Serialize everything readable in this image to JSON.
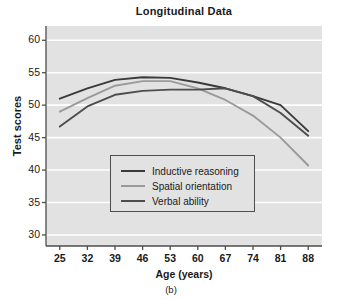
{
  "figure": {
    "caption": "(b)"
  },
  "chart_data": {
    "type": "line",
    "title": "Longitudinal Data",
    "xlabel": "Age (years)",
    "ylabel": "Test scores",
    "x": [
      25,
      32,
      39,
      46,
      53,
      60,
      67,
      74,
      81,
      88
    ],
    "categories": [
      "25",
      "32",
      "39",
      "46",
      "53",
      "60",
      "67",
      "74",
      "81",
      "88"
    ],
    "xlim": [
      21.5,
      91.5
    ],
    "ylim": [
      28.3,
      62.2
    ],
    "yticks": [
      30,
      35,
      40,
      45,
      50,
      55,
      60
    ],
    "ytick_labels": [
      "30",
      "35",
      "40",
      "45",
      "50",
      "55",
      "60"
    ],
    "grid": "horizontal-white",
    "plot_background": "#e2e2e2",
    "legend_position": "lower-center-left",
    "series": [
      {
        "name": "Inductive reasoning",
        "color": "#3a3a3a",
        "values": [
          51.0,
          52.6,
          53.9,
          54.3,
          54.2,
          53.5,
          52.6,
          51.4,
          50.0,
          46.0
        ]
      },
      {
        "name": "Spatial orientation",
        "color": "#9a9a9a",
        "values": [
          49.0,
          51.1,
          53.0,
          53.7,
          53.7,
          52.6,
          50.8,
          48.4,
          45.0,
          40.7
        ]
      },
      {
        "name": "Verbal ability",
        "color": "#4d4d4d",
        "values": [
          46.7,
          49.8,
          51.6,
          52.2,
          52.4,
          52.4,
          52.6,
          51.4,
          48.8,
          45.3
        ]
      }
    ]
  }
}
